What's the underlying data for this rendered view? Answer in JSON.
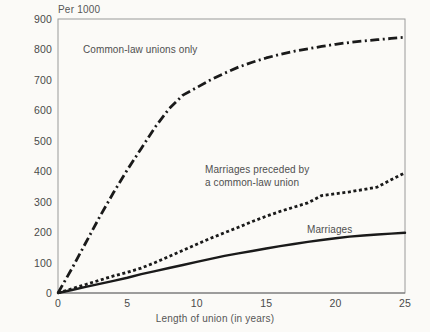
{
  "chart_data": {
    "type": "line",
    "title": "",
    "subtitle": "",
    "ylabel": "Per 1000",
    "xlabel": "Length of union (in years)",
    "xlim": [
      0,
      25
    ],
    "ylim": [
      0,
      900
    ],
    "grid": false,
    "legend_position": "inline-annotations",
    "xticks": [
      "0",
      "5",
      "10",
      "15",
      "20",
      "25"
    ],
    "xtick_values": [
      0,
      5,
      10,
      15,
      20,
      25
    ],
    "yticks": [
      "0",
      "100",
      "200",
      "300",
      "400",
      "500",
      "600",
      "700",
      "800",
      "900"
    ],
    "ytick_values": [
      0,
      100,
      200,
      300,
      400,
      500,
      600,
      700,
      800,
      900
    ],
    "x": [
      0,
      1,
      2,
      3,
      4,
      5,
      6,
      7,
      8,
      9,
      10,
      11,
      12,
      13,
      14,
      15,
      16,
      17,
      18,
      19,
      20,
      21,
      22,
      23,
      24,
      25
    ],
    "series": [
      {
        "name": "Common-law unions only",
        "style": "dash-dot",
        "color": "#1a1a1a",
        "values": [
          0,
          80,
          165,
          250,
          330,
          405,
          475,
          545,
          605,
          650,
          675,
          700,
          722,
          742,
          758,
          772,
          784,
          794,
          802,
          810,
          817,
          823,
          828,
          832,
          836,
          840
        ]
      },
      {
        "name": "Marriages preceded by a common-law union",
        "style": "dotted",
        "color": "#1a1a1a",
        "values": [
          0,
          14,
          28,
          42,
          56,
          68,
          82,
          100,
          120,
          140,
          160,
          180,
          198,
          216,
          235,
          252,
          268,
          282,
          296,
          320,
          326,
          332,
          340,
          348,
          372,
          395
        ]
      },
      {
        "name": "Marriages",
        "style": "solid",
        "color": "#1a1a1a",
        "values": [
          0,
          10,
          20,
          30,
          40,
          50,
          62,
          72,
          82,
          92,
          102,
          112,
          122,
          130,
          138,
          146,
          154,
          161,
          168,
          174,
          180,
          185,
          189,
          192,
          195,
          198
        ]
      }
    ]
  },
  "labels": {
    "ylabel_title": "Per 1000",
    "xlabel_title": "Length of union (in years)",
    "series_commonlaw": "Common-law unions only",
    "series_preceded": "Marriages preceded by\na common-law union",
    "series_marriages": "Marriages"
  },
  "colors": {
    "background": "#fbfaf7",
    "line": "#1a1a1a",
    "frame": "#9a9a9a",
    "text": "#4a4a4a"
  }
}
